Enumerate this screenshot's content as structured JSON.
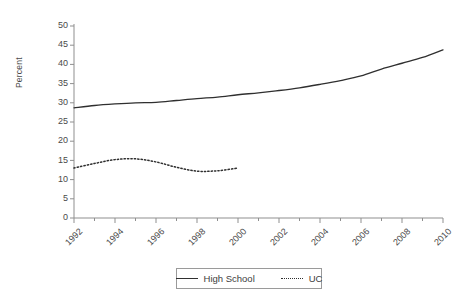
{
  "chart_data": {
    "type": "line",
    "title": "",
    "xlabel": "",
    "ylabel": "Percent",
    "xlim": [
      1992,
      2010
    ],
    "ylim": [
      0,
      50
    ],
    "ytick_step": 5,
    "xtick_step": 2,
    "minor_xticks": true,
    "grid": false,
    "legend_position": "bottom",
    "yticks": [
      "50",
      "45",
      "40",
      "35",
      "30",
      "25",
      "20",
      "15",
      "10",
      "5",
      "0"
    ],
    "ytick_values": [
      50,
      45,
      40,
      35,
      30,
      25,
      20,
      15,
      10,
      5,
      0
    ],
    "xticks": [
      "1992",
      "1994",
      "1996",
      "1998",
      "2000",
      "2002",
      "2004",
      "2006",
      "2008",
      "2010"
    ],
    "xtick_values": [
      1992,
      1994,
      1996,
      1998,
      2000,
      2002,
      2004,
      2006,
      2008,
      2010
    ],
    "series": [
      {
        "name": "High School",
        "style": "solid",
        "color": "#2f2f2f",
        "x": [
          1992,
          1993,
          1994,
          1995,
          1996,
          1997,
          1998,
          1999,
          2000,
          2001,
          2002,
          2003,
          2004,
          2005,
          2006,
          2007,
          2008,
          2009,
          2010
        ],
        "values": [
          28.7,
          29.3,
          29.7,
          30.0,
          30.1,
          30.6,
          31.1,
          31.5,
          32.1,
          32.6,
          33.2,
          33.9,
          34.8,
          35.8,
          37.0,
          38.8,
          40.3,
          41.8,
          43.8
        ]
      },
      {
        "name": "UC",
        "style": "dotted",
        "color": "#2f2f2f",
        "x": [
          1992,
          1993,
          1994,
          1995,
          1996,
          1997,
          1998,
          1999,
          2000
        ],
        "values": [
          13.0,
          14.2,
          15.2,
          15.4,
          14.6,
          13.2,
          12.2,
          12.3,
          13.0
        ]
      }
    ],
    "legend": [
      {
        "label": "High School",
        "style": "solid"
      },
      {
        "label": "UC",
        "style": "dotted"
      }
    ]
  }
}
